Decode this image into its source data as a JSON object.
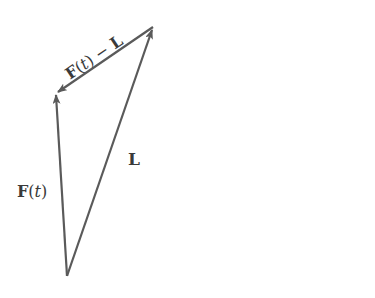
{
  "diagram": {
    "type": "vector-triangle",
    "stroke_color": "#5a5a5a",
    "vertices": {
      "bottom": [
        67,
        276
      ],
      "top_left": [
        56,
        93
      ],
      "top_right": [
        153,
        27
      ]
    },
    "vectors": [
      {
        "name": "F(t)",
        "from": "bottom",
        "to": "top_left"
      },
      {
        "name": "L",
        "from": "bottom",
        "to": "top_right"
      },
      {
        "name": "F(t) - L",
        "from": "top_right",
        "to": "top_left"
      }
    ],
    "labels": {
      "ft_bold": "F",
      "ft_paren_open": "(",
      "ft_t": "t",
      "ft_paren_close": ")",
      "l": "L",
      "diff_f": "F",
      "diff_open": "(",
      "diff_t": "t",
      "diff_close": ")",
      "diff_minus": " − ",
      "diff_l": "L"
    }
  }
}
